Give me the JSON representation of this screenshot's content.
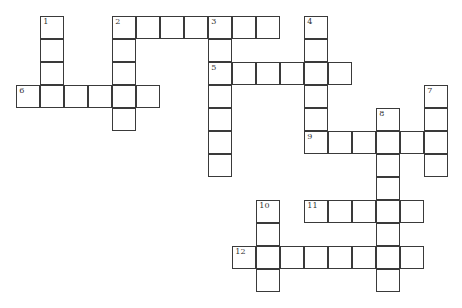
{
  "puzzle": {
    "type": "crossword",
    "grid_origin": {
      "x": 17,
      "y": 17
    },
    "cell": {
      "width": 24,
      "height": 23
    },
    "colors": {
      "border": "#3a3a3a",
      "fill": "#ffffff",
      "number": "#333333"
    },
    "entries": [
      {
        "number": "1",
        "direction": "down",
        "col": 1,
        "row": 0,
        "length": 4
      },
      {
        "number": "2",
        "direction": "across",
        "col": 4,
        "row": 0,
        "length": 7
      },
      {
        "number": "2",
        "direction": "down",
        "col": 4,
        "row": 0,
        "length": 5
      },
      {
        "number": "3",
        "direction": "down",
        "col": 8,
        "row": 0,
        "length": 7
      },
      {
        "number": "4",
        "direction": "down",
        "col": 12,
        "row": 0,
        "length": 6
      },
      {
        "number": "5",
        "direction": "across",
        "col": 8,
        "row": 2,
        "length": 6
      },
      {
        "number": "6",
        "direction": "across",
        "col": 0,
        "row": 3,
        "length": 6
      },
      {
        "number": "7",
        "direction": "down",
        "col": 17,
        "row": 3,
        "length": 4
      },
      {
        "number": "8",
        "direction": "down",
        "col": 15,
        "row": 4,
        "length": 8
      },
      {
        "number": "9",
        "direction": "across",
        "col": 12,
        "row": 5,
        "length": 6
      },
      {
        "number": "10",
        "direction": "down",
        "col": 10,
        "row": 8,
        "length": 4
      },
      {
        "number": "11",
        "direction": "across",
        "col": 12,
        "row": 8,
        "length": 5
      },
      {
        "number": "12",
        "direction": "across",
        "col": 9,
        "row": 10,
        "length": 8
      }
    ]
  }
}
